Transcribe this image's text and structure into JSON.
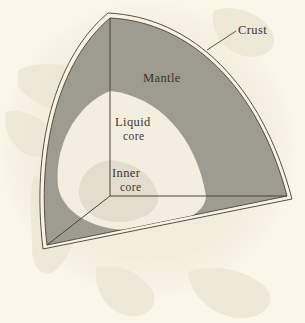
{
  "figure": {
    "background_color": "#faf6e8",
    "labels": {
      "crust": "Crust",
      "mantle": "Mantle",
      "liquid_core_line1": "Liquid",
      "liquid_core_line2": "core",
      "inner_core_line1": "Inner",
      "inner_core_line2": "core"
    },
    "colors": {
      "background": "#faf6e8",
      "mantle": "#9e9b90",
      "liquid_core": "#f3eee0",
      "inner_core": "#e4ded0",
      "crust_band": "#f6f1e3",
      "outline": "#4a453b",
      "text": "#3b362c",
      "watermark": "#efe9d8"
    }
  }
}
